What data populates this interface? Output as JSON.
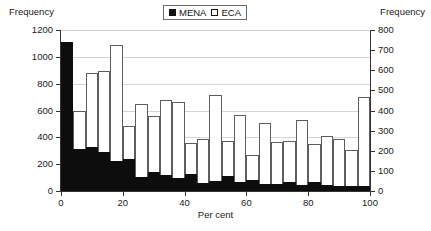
{
  "chart_data": {
    "type": "bar",
    "title": "",
    "subtitle": "",
    "xlabel": "Per cent",
    "ylabel_left": "Frequency",
    "ylabel_right": "Frequency",
    "grid": true,
    "legend_position": "top-center",
    "bin_width": 4,
    "x": [
      2,
      6,
      10,
      14,
      18,
      22,
      26,
      30,
      34,
      38,
      42,
      46,
      50,
      54,
      58,
      62,
      66,
      70,
      74,
      78,
      82,
      86,
      90,
      94,
      98
    ],
    "xlim": [
      0,
      100
    ],
    "xticks": [
      0,
      20,
      40,
      60,
      80,
      100
    ],
    "xticklabels": [
      "0",
      "20",
      "40",
      "60",
      "80",
      "100"
    ],
    "ylim_left": [
      0,
      1200
    ],
    "yticks_left": [
      0,
      200,
      400,
      600,
      800,
      1000,
      1200
    ],
    "yticklabels_left": [
      "0",
      "200",
      "400",
      "600",
      "800",
      "1000",
      "1200"
    ],
    "ylim_right": [
      0,
      800
    ],
    "yticks_right": [
      0,
      100,
      200,
      300,
      400,
      500,
      600,
      700,
      800
    ],
    "yticklabels_right": [
      "0",
      "100",
      "200",
      "300",
      "400",
      "500",
      "600",
      "700",
      "800"
    ],
    "series": [
      {
        "name": "MENA",
        "axis": "left",
        "color": "#0d0d0d",
        "style": "filled",
        "values": [
          1110,
          310,
          325,
          290,
          225,
          240,
          105,
          140,
          120,
          100,
          125,
          60,
          75,
          115,
          70,
          80,
          55,
          50,
          70,
          45,
          65,
          45,
          35,
          40,
          40
        ]
      },
      {
        "name": "ECA",
        "axis": "right",
        "color": "#ffffff",
        "style": "open",
        "values": [
          140,
          400,
          585,
          595,
          725,
          325,
          430,
          375,
          450,
          440,
          240,
          260,
          475,
          250,
          380,
          180,
          340,
          245,
          250,
          355,
          235,
          275,
          260,
          205,
          465
        ]
      }
    ]
  }
}
